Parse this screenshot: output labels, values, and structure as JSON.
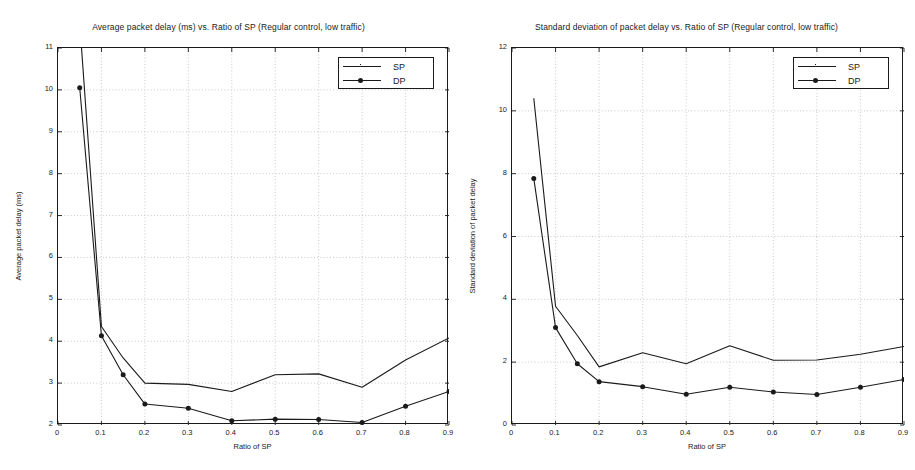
{
  "figure": {
    "background": "#ffffff",
    "ink": "#1a1a1a",
    "grid_color": "#bdbdbd"
  },
  "charts": [
    {
      "id": "average-packet-delay",
      "title": "Average packet delay (ms) vs. Ratio of SP (Regular control, low traffic)",
      "xlabel": "Ratio of SP",
      "ylabel": "Average packet delay (ms)",
      "xticks": [
        "0",
        "0.1",
        "0.2",
        "0.3",
        "0.4",
        "0.5",
        "0.6",
        "0.7",
        "0.8",
        "0.9"
      ],
      "yticks": [
        "2",
        "3",
        "4",
        "5",
        "6",
        "7",
        "8",
        "9",
        "10",
        "11"
      ],
      "legend": [
        {
          "label": "SP",
          "marker": "none"
        },
        {
          "label": "DP",
          "marker": "filled-circle"
        }
      ]
    },
    {
      "id": "std-deviation-packet-delay",
      "title": "Standard deviation of packet delay vs. Ratio of SP (Regular control, low traffic)",
      "xlabel": "Ratio of SP",
      "ylabel": "Standard deviation of packet delay",
      "xticks": [
        "0",
        "0.1",
        "0.2",
        "0.3",
        "0.4",
        "0.5",
        "0.6",
        "0.7",
        "0.8",
        "0.9"
      ],
      "yticks": [
        "0",
        "2",
        "4",
        "6",
        "8",
        "10",
        "12"
      ],
      "legend": [
        {
          "label": "SP",
          "marker": "none"
        },
        {
          "label": "DP",
          "marker": "filled-circle"
        }
      ]
    }
  ],
  "chart_data": [
    {
      "type": "line",
      "title": "Average packet delay (ms) vs. Ratio of SP (Regular control, low traffic)",
      "xlabel": "Ratio of SP",
      "ylabel": "Average packet delay (ms)",
      "xlim": [
        0,
        0.9
      ],
      "ylim": [
        2,
        11
      ],
      "xticks": [
        0,
        0.1,
        0.2,
        0.3,
        0.4,
        0.5,
        0.6,
        0.7,
        0.8,
        0.9
      ],
      "yticks": [
        2,
        3,
        4,
        5,
        6,
        7,
        8,
        9,
        10,
        11
      ],
      "grid": true,
      "legend_position": "top-right",
      "x": [
        0.05,
        0.1,
        0.15,
        0.2,
        0.3,
        0.4,
        0.5,
        0.6,
        0.7,
        0.8,
        0.9
      ],
      "series": [
        {
          "name": "SP",
          "marker": "none",
          "values": [
            11.6,
            4.35,
            3.6,
            3.0,
            2.97,
            2.8,
            3.2,
            3.22,
            2.9,
            3.55,
            4.08
          ],
          "note": "value at x=0.05 is clipped above the axis top (11)"
        },
        {
          "name": "DP",
          "marker": "filled-circle",
          "values": [
            10.05,
            4.13,
            3.2,
            2.5,
            2.4,
            2.1,
            2.14,
            2.13,
            2.06,
            2.45,
            2.8
          ]
        }
      ]
    },
    {
      "type": "line",
      "title": "Standard deviation of packet delay vs. Ratio of SP (Regular control, low traffic)",
      "xlabel": "Ratio of SP",
      "ylabel": "Standard deviation of packet delay",
      "xlim": [
        0,
        0.9
      ],
      "ylim": [
        0,
        12
      ],
      "xticks": [
        0,
        0.1,
        0.2,
        0.3,
        0.4,
        0.5,
        0.6,
        0.7,
        0.8,
        0.9
      ],
      "yticks": [
        0,
        2,
        4,
        6,
        8,
        10,
        12
      ],
      "grid": true,
      "legend_position": "top-right",
      "x": [
        0.05,
        0.1,
        0.15,
        0.2,
        0.3,
        0.4,
        0.5,
        0.6,
        0.7,
        0.8,
        0.9
      ],
      "series": [
        {
          "name": "SP",
          "marker": "none",
          "values": [
            10.4,
            3.78,
            2.85,
            1.85,
            2.3,
            1.95,
            2.52,
            2.06,
            2.07,
            2.25,
            2.5
          ]
        },
        {
          "name": "DP",
          "marker": "filled-circle",
          "values": [
            7.85,
            3.1,
            1.95,
            1.38,
            1.22,
            0.98,
            1.2,
            1.05,
            0.97,
            1.2,
            1.45
          ]
        }
      ]
    }
  ]
}
